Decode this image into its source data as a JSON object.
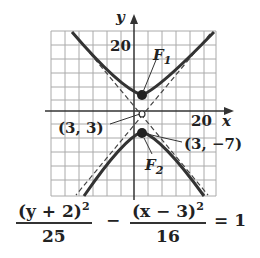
{
  "graph": {
    "y_axis_label": "y",
    "x_axis_label": "x",
    "y_tick_label": "20",
    "x_tick_label": "20",
    "focus1_label": "F",
    "focus1_sub": "1",
    "focus2_label": "F",
    "focus2_sub": "2",
    "center_label": "(3, 3)",
    "vertex_label": "(3, −7)",
    "colors": {
      "curve": "#333333",
      "grid": "#aaaaaa",
      "axis": "#333333"
    }
  },
  "equation": {
    "term1_num": "(y + 2)",
    "term1_exp": "2",
    "term1_den": "25",
    "minus": "−",
    "term2_num": "(x − 3)",
    "term2_exp": "2",
    "term2_den": "16",
    "equals": "= 1"
  }
}
